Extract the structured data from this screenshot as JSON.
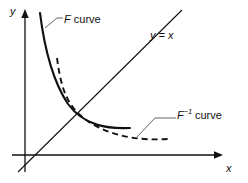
{
  "figure": {
    "background_color": "#ffffff",
    "stroke_color": "#111111",
    "leader_color": "#555555",
    "width": 248,
    "height": 183
  },
  "axes": {
    "x_axis": {
      "label": "x",
      "name": "x-axis",
      "arrow": "right",
      "start_px": [
        12,
        155
      ],
      "end_px": [
        222,
        155
      ]
    },
    "y_axis": {
      "label": "y",
      "name": "y-axis",
      "arrow": "up",
      "start_px": [
        25,
        172
      ],
      "end_px": [
        25,
        10
      ]
    },
    "origin_px": [
      25,
      155
    ]
  },
  "reference_line": {
    "label": "y = x",
    "name": "identity-line",
    "style": "solid",
    "start_px": [
      18,
      172
    ],
    "end_px": [
      182,
      10
    ]
  },
  "curves": [
    {
      "id": "f-curve",
      "label_symbol": "F",
      "label_superscript": "",
      "label_word": "curve",
      "style": "solid",
      "description": "Decreasing convex curve, steep near the y-axis, flattening toward the x-axis",
      "path_px": "M 40,13 C 44,45 52,80 68,104 C 84,126 108,129 130,128",
      "leader_px": "M 45,28 L 57,18 L 63,18"
    },
    {
      "id": "f-inverse-curve",
      "label_symbol": "F",
      "label_superscript": "-1",
      "label_word": "curve",
      "style": "dashed",
      "description": "Mirror image of the F curve reflected about the line y = x",
      "path_px": "M 57,58 C 60,80 64,101 80,115 C 104,136 138,141 168,139",
      "leader_px": "M 137,137 L 155,118 L 176,118"
    }
  ],
  "intersection": {
    "name": "curve-intersection-point",
    "px": [
      72,
      113
    ],
    "note": "F and F inverse meet on the line y = x"
  },
  "labels": {
    "y_axis": "y",
    "x_axis": "x",
    "identity_line": "y = x",
    "f_curve_symbol": "F",
    "f_curve_word": "curve",
    "finv_curve_symbol": "F",
    "finv_curve_superscript": "−1",
    "finv_curve_word": "curve"
  }
}
